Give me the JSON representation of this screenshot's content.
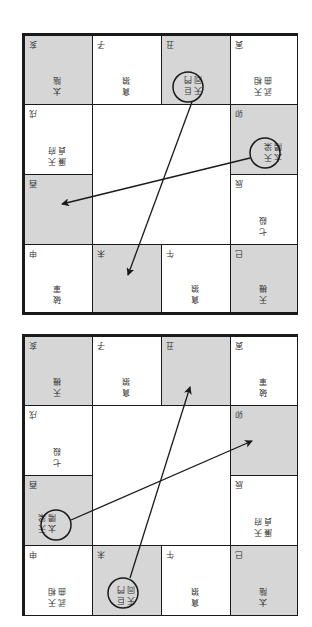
{
  "charts": [
    {
      "id": "chart-top",
      "cells": [
        {
          "branch": "亥",
          "stars": [
            "太陰"
          ],
          "shade": "gray"
        },
        {
          "branch": "子",
          "stars": [
            "貪狼"
          ],
          "shade": "white"
        },
        {
          "branch": "丑",
          "stars": [
            "天同",
            "巨門"
          ],
          "shade": "gray",
          "circled": true
        },
        {
          "branch": "寅",
          "stars": [
            "武曲",
            "天相"
          ],
          "shade": "white"
        },
        {
          "branch": "戌",
          "stars": [
            "廉貞",
            "天府"
          ],
          "shade": "white"
        },
        {
          "branch": "卯",
          "stars": [
            "太陽",
            "天梁"
          ],
          "shade": "gray",
          "circled": true
        },
        {
          "branch": "酉",
          "stars": [],
          "shade": "gray"
        },
        {
          "branch": "辰",
          "stars": [
            "七殺"
          ],
          "shade": "white"
        },
        {
          "branch": "申",
          "stars": [
            "破軍"
          ],
          "shade": "white"
        },
        {
          "branch": "未",
          "stars": [],
          "shade": "gray"
        },
        {
          "branch": "午",
          "stars": [
            "貪狼"
          ],
          "shade": "white"
        },
        {
          "branch": "巳",
          "stars": [
            "天機"
          ],
          "shade": "gray"
        }
      ]
    },
    {
      "id": "chart-bottom",
      "cells": [
        {
          "branch": "亥",
          "stars": [
            "天機"
          ],
          "shade": "gray"
        },
        {
          "branch": "子",
          "stars": [
            "貪狼"
          ],
          "shade": "white"
        },
        {
          "branch": "丑",
          "stars": [],
          "shade": "gray"
        },
        {
          "branch": "寅",
          "stars": [
            "破軍"
          ],
          "shade": "white"
        },
        {
          "branch": "戌",
          "stars": [
            "七殺"
          ],
          "shade": "white"
        },
        {
          "branch": "卯",
          "stars": [],
          "shade": "gray"
        },
        {
          "branch": "酉",
          "stars": [
            "太陽",
            "天梁"
          ],
          "shade": "gray",
          "circled": true
        },
        {
          "branch": "辰",
          "stars": [
            "廉貞",
            "天府"
          ],
          "shade": "white"
        },
        {
          "branch": "申",
          "stars": [
            "武曲",
            "天相"
          ],
          "shade": "white"
        },
        {
          "branch": "未",
          "stars": [
            "天同",
            "巨門"
          ],
          "shade": "gray",
          "circled": true
        },
        {
          "branch": "午",
          "stars": [
            "貪狼"
          ],
          "shade": "white"
        },
        {
          "branch": "巳",
          "stars": [
            "太陰"
          ],
          "shade": "gray"
        }
      ]
    }
  ],
  "colors": {
    "line": "#1a1a1a",
    "shade": "#d6d6d6",
    "text": "#333333"
  }
}
